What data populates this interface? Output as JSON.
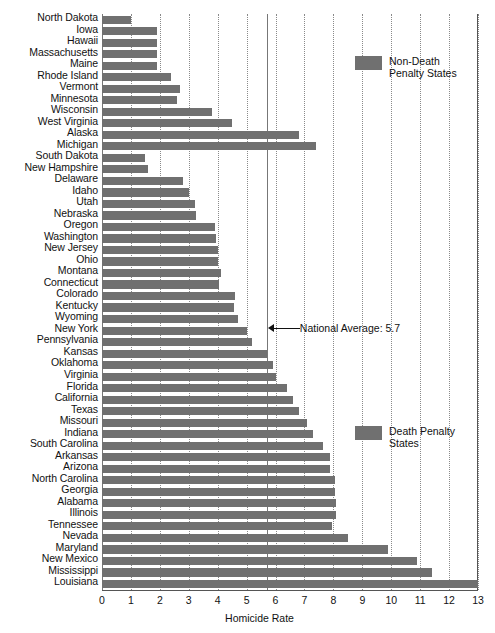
{
  "chart_data": {
    "type": "bar",
    "orientation": "horizontal",
    "title": "",
    "xlabel": "Homicide Rate",
    "ylabel": "",
    "xlim": [
      0,
      13
    ],
    "xticks": [
      0,
      1,
      2,
      3,
      4,
      5,
      6,
      7,
      8,
      9,
      10,
      11,
      12,
      13
    ],
    "grid": "vertical-dotted",
    "legend_position": "right",
    "bar_color": "#707070",
    "categories": [
      "North Dakota",
      "Iowa",
      "Hawaii",
      "Massachusetts",
      "Maine",
      "Rhode Island",
      "Vermont",
      "Minnesota",
      "Wisconsin",
      "West Virginia",
      "Alaska",
      "Michigan",
      "South Dakota",
      "New Hampshire",
      "Delaware",
      "Idaho",
      "Utah",
      "Nebraska",
      "Oregon",
      "Washington",
      "New Jersey",
      "Ohio",
      "Montana",
      "Connecticut",
      "Colorado",
      "Kentucky",
      "Wyoming",
      "New York",
      "Pennsylvania",
      "Kansas",
      "Oklahoma",
      "Virginia",
      "Florida",
      "California",
      "Texas",
      "Missouri",
      "Indiana",
      "South Carolina",
      "Arkansas",
      "Arizona",
      "North Carolina",
      "Georgia",
      "Alabama",
      "Illinois",
      "Tennessee",
      "Nevada",
      "Maryland",
      "New Mexico",
      "Mississippi",
      "Louisiana"
    ],
    "values": [
      1.0,
      1.9,
      1.9,
      1.9,
      1.9,
      2.4,
      2.7,
      2.6,
      3.8,
      4.5,
      6.8,
      7.4,
      1.5,
      1.6,
      2.8,
      3.0,
      3.2,
      3.25,
      3.9,
      3.95,
      4.0,
      4.0,
      4.1,
      4.05,
      4.6,
      4.55,
      4.7,
      5.0,
      5.2,
      5.7,
      5.9,
      6.0,
      6.4,
      6.6,
      6.8,
      7.1,
      7.3,
      7.65,
      7.9,
      7.9,
      8.05,
      8.05,
      8.1,
      8.1,
      7.95,
      8.5,
      9.9,
      10.9,
      11.4,
      13.0
    ],
    "groups": [
      "non-death",
      "non-death",
      "non-death",
      "non-death",
      "non-death",
      "non-death",
      "non-death",
      "non-death",
      "non-death",
      "non-death",
      "non-death",
      "non-death",
      "death",
      "death",
      "death",
      "death",
      "death",
      "death",
      "death",
      "death",
      "death",
      "death",
      "death",
      "death",
      "death",
      "death",
      "death",
      "death",
      "death",
      "death",
      "death",
      "death",
      "death",
      "death",
      "death",
      "death",
      "death",
      "death",
      "death",
      "death",
      "death",
      "death",
      "death",
      "death",
      "death",
      "death",
      "death",
      "death",
      "death",
      "death"
    ],
    "series": [
      {
        "name": "Non-Death Penalty States",
        "color": "#707070"
      },
      {
        "name": "Death Penalty States",
        "color": "#707070"
      }
    ],
    "annotations": [
      {
        "label": "National Average: 5.7",
        "value": 5.7,
        "arrow": "left"
      }
    ]
  },
  "legend": {
    "non_death": "Non-Death\nPenalty States",
    "death": "Death Penalty\nStates"
  },
  "annotation": {
    "national_average": "National Average: 5.7"
  },
  "axis": {
    "x_title": "Homicide Rate"
  }
}
